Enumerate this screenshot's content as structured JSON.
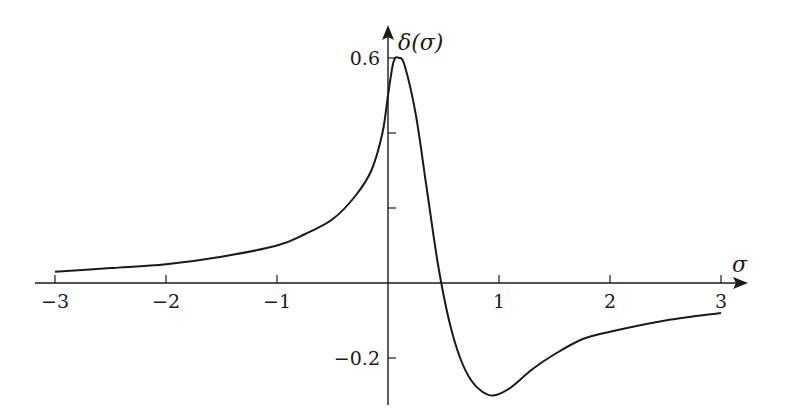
{
  "chart_data": {
    "type": "line",
    "title": "",
    "xlabel": "σ",
    "ylabel": "δ(σ)",
    "xlim": [
      -3,
      3
    ],
    "ylim": [
      -0.3,
      0.6
    ],
    "grid": false,
    "legend": null,
    "x_ticks": [
      {
        "value": -3,
        "label": "−3"
      },
      {
        "value": -2,
        "label": "−2"
      },
      {
        "value": -1,
        "label": "−1"
      },
      {
        "value": 1,
        "label": "1"
      },
      {
        "value": 2,
        "label": "2"
      },
      {
        "value": 3,
        "label": "3"
      }
    ],
    "y_ticks": [
      {
        "value": 0.6,
        "label": "0.6"
      },
      {
        "value": 0.4,
        "label": ""
      },
      {
        "value": 0.2,
        "label": ""
      },
      {
        "value": -0.2,
        "label": "−0.2"
      }
    ],
    "y_ticks_note": "0.6 and −0.2 are labeled in the image. The two unlabeled ticks are assumed to be 0.2 and 0.4 from even spacing.",
    "values_note": "Approximate: the series values below are estimated from the curve's shape and are not precise pixel measurements.",
    "series": [
      {
        "name": "δ(σ)",
        "x": [
          -3,
          -2.5,
          -2,
          -1.5,
          -1,
          -0.75,
          -0.5,
          -0.3,
          -0.15,
          -0.05,
          0,
          0.05,
          0.1,
          0.15,
          0.25,
          0.35,
          0.45,
          0.55,
          0.65,
          0.75,
          0.85,
          0.95,
          1.1,
          1.3,
          1.5,
          1.75,
          2,
          2.5,
          3
        ],
        "y": [
          0.03,
          0.04,
          0.05,
          0.07,
          0.1,
          0.13,
          0.17,
          0.23,
          0.3,
          0.4,
          0.5,
          0.59,
          0.6,
          0.58,
          0.45,
          0.25,
          0.05,
          -0.1,
          -0.2,
          -0.26,
          -0.29,
          -0.3,
          -0.28,
          -0.23,
          -0.19,
          -0.15,
          -0.13,
          -0.1,
          -0.08
        ]
      }
    ]
  },
  "labels": {
    "x_axis": "σ",
    "y_axis": "δ(σ)"
  }
}
